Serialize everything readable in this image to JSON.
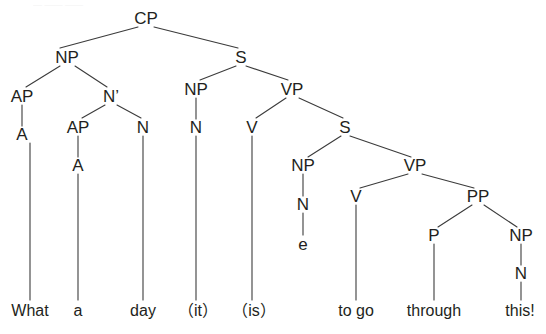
{
  "diagram": {
    "kind": "syntax-tree",
    "sentence": "What a day (it is) to go through this!",
    "line_color": "#3b3b3b",
    "text_color": "#231f20",
    "background": "#ffffff",
    "nodes": [
      {
        "id": "cp",
        "label": "CP",
        "x": 146,
        "y": 18,
        "type": "nonterminal"
      },
      {
        "id": "np1",
        "label": "NP",
        "x": 67,
        "y": 57,
        "type": "nonterminal"
      },
      {
        "id": "s1",
        "label": "S",
        "x": 241,
        "y": 57,
        "type": "nonterminal"
      },
      {
        "id": "ap1",
        "label": "AP",
        "x": 22,
        "y": 96,
        "type": "nonterminal"
      },
      {
        "id": "nbar",
        "label": "N’",
        "x": 111,
        "y": 96,
        "type": "nonterminal"
      },
      {
        "id": "np2",
        "label": "NP",
        "x": 196,
        "y": 89,
        "type": "nonterminal"
      },
      {
        "id": "vp1",
        "label": "VP",
        "x": 292,
        "y": 89,
        "type": "nonterminal"
      },
      {
        "id": "a1",
        "label": "A",
        "x": 22,
        "y": 134,
        "type": "nonterminal"
      },
      {
        "id": "ap2",
        "label": "AP",
        "x": 78,
        "y": 127,
        "type": "nonterminal"
      },
      {
        "id": "n1",
        "label": "N",
        "x": 143,
        "y": 127,
        "type": "nonterminal"
      },
      {
        "id": "n2",
        "label": "N",
        "x": 196,
        "y": 127,
        "type": "nonterminal"
      },
      {
        "id": "v1",
        "label": "V",
        "x": 252,
        "y": 127,
        "type": "nonterminal"
      },
      {
        "id": "s2",
        "label": "S",
        "x": 345,
        "y": 127,
        "type": "nonterminal"
      },
      {
        "id": "a2",
        "label": "A",
        "x": 78,
        "y": 165,
        "type": "nonterminal"
      },
      {
        "id": "np3",
        "label": "NP",
        "x": 303,
        "y": 165,
        "type": "nonterminal"
      },
      {
        "id": "vp2",
        "label": "VP",
        "x": 415,
        "y": 165,
        "type": "nonterminal"
      },
      {
        "id": "n3",
        "label": "N",
        "x": 303,
        "y": 204,
        "type": "nonterminal"
      },
      {
        "id": "v2",
        "label": "V",
        "x": 356,
        "y": 196,
        "type": "nonterminal"
      },
      {
        "id": "pp",
        "label": "PP",
        "x": 478,
        "y": 196,
        "type": "nonterminal"
      },
      {
        "id": "e",
        "label": "e",
        "x": 303,
        "y": 244,
        "type": "empty-category"
      },
      {
        "id": "p",
        "label": "P",
        "x": 434,
        "y": 235,
        "type": "nonterminal"
      },
      {
        "id": "np4",
        "label": "NP",
        "x": 521,
        "y": 235,
        "type": "nonterminal"
      },
      {
        "id": "n4",
        "label": "N",
        "x": 521,
        "y": 273,
        "type": "nonterminal"
      }
    ],
    "terminals": [
      {
        "id": "w-what",
        "label": "What",
        "x": 30,
        "y": 311
      },
      {
        "id": "w-a",
        "label": "a",
        "x": 78,
        "y": 311
      },
      {
        "id": "w-day",
        "label": "day",
        "x": 143,
        "y": 311
      },
      {
        "id": "w-it",
        "label": "（it）",
        "x": 198,
        "y": 311
      },
      {
        "id": "w-is",
        "label": "（is）",
        "x": 254,
        "y": 311
      },
      {
        "id": "w-togo",
        "label": "to go",
        "x": 356,
        "y": 311
      },
      {
        "id": "w-through",
        "label": "through",
        "x": 434,
        "y": 311
      },
      {
        "id": "w-this",
        "label": "this!",
        "x": 520,
        "y": 311
      }
    ],
    "edges": [
      {
        "from": "cp",
        "to": "np1",
        "x1": 138,
        "y1": 27,
        "x2": 60,
        "y2": 48
      },
      {
        "from": "cp",
        "to": "s1",
        "x1": 154,
        "y1": 27,
        "x2": 238,
        "y2": 48
      },
      {
        "from": "np1",
        "to": "ap1",
        "x1": 60,
        "y1": 66,
        "x2": 26,
        "y2": 87
      },
      {
        "from": "np1",
        "to": "nbar",
        "x1": 75,
        "y1": 66,
        "x2": 107,
        "y2": 87
      },
      {
        "from": "s1",
        "to": "np2",
        "x1": 236,
        "y1": 66,
        "x2": 200,
        "y2": 80
      },
      {
        "from": "s1",
        "to": "vp1",
        "x1": 246,
        "y1": 66,
        "x2": 288,
        "y2": 80
      },
      {
        "from": "ap1",
        "to": "a1",
        "x1": 22,
        "y1": 105,
        "x2": 22,
        "y2": 126,
        "style": "short"
      },
      {
        "from": "nbar",
        "to": "ap2",
        "x1": 105,
        "y1": 105,
        "x2": 82,
        "y2": 118
      },
      {
        "from": "nbar",
        "to": "n1",
        "x1": 117,
        "y1": 105,
        "x2": 141,
        "y2": 118
      },
      {
        "from": "np2",
        "to": "n2",
        "x1": 196,
        "y1": 98,
        "x2": 196,
        "y2": 119,
        "style": "short"
      },
      {
        "from": "vp1",
        "to": "v1",
        "x1": 286,
        "y1": 98,
        "x2": 256,
        "y2": 118
      },
      {
        "from": "vp1",
        "to": "s2",
        "x1": 299,
        "y1": 98,
        "x2": 343,
        "y2": 118
      },
      {
        "from": "ap2",
        "to": "a2",
        "x1": 78,
        "y1": 136,
        "x2": 78,
        "y2": 157,
        "style": "short"
      },
      {
        "from": "s2",
        "to": "np3",
        "x1": 341,
        "y1": 136,
        "x2": 308,
        "y2": 157
      },
      {
        "from": "s2",
        "to": "vp2",
        "x1": 350,
        "y1": 136,
        "x2": 411,
        "y2": 157
      },
      {
        "from": "np3",
        "to": "n3",
        "x1": 303,
        "y1": 174,
        "x2": 303,
        "y2": 196,
        "style": "short"
      },
      {
        "from": "vp2",
        "to": "v2",
        "x1": 408,
        "y1": 174,
        "x2": 360,
        "y2": 188
      },
      {
        "from": "vp2",
        "to": "pp",
        "x1": 422,
        "y1": 174,
        "x2": 474,
        "y2": 188
      },
      {
        "from": "n3",
        "to": "e",
        "x1": 303,
        "y1": 213,
        "x2": 303,
        "y2": 235,
        "style": "short"
      },
      {
        "from": "pp",
        "to": "p",
        "x1": 472,
        "y1": 205,
        "x2": 438,
        "y2": 227
      },
      {
        "from": "pp",
        "to": "np4",
        "x1": 484,
        "y1": 205,
        "x2": 517,
        "y2": 227
      },
      {
        "from": "np4",
        "to": "n4",
        "x1": 521,
        "y1": 244,
        "x2": 521,
        "y2": 265,
        "style": "short"
      },
      {
        "from": "a1",
        "to": "w-what",
        "x1": 30,
        "y1": 143,
        "x2": 30,
        "y2": 300,
        "style": "long"
      },
      {
        "from": "a2",
        "to": "w-a",
        "x1": 78,
        "y1": 174,
        "x2": 78,
        "y2": 300,
        "style": "long"
      },
      {
        "from": "n1",
        "to": "w-day",
        "x1": 143,
        "y1": 136,
        "x2": 143,
        "y2": 300,
        "style": "long"
      },
      {
        "from": "n2",
        "to": "w-it",
        "x1": 196,
        "y1": 136,
        "x2": 196,
        "y2": 300,
        "style": "long"
      },
      {
        "from": "v1",
        "to": "w-is",
        "x1": 252,
        "y1": 136,
        "x2": 252,
        "y2": 300,
        "style": "long"
      },
      {
        "from": "v2",
        "to": "w-togo",
        "x1": 356,
        "y1": 205,
        "x2": 356,
        "y2": 300,
        "style": "long"
      },
      {
        "from": "p",
        "to": "w-through",
        "x1": 434,
        "y1": 244,
        "x2": 434,
        "y2": 300,
        "style": "long"
      },
      {
        "from": "n4",
        "to": "w-this",
        "x1": 521,
        "y1": 282,
        "x2": 521,
        "y2": 300,
        "style": "long"
      }
    ],
    "artifact_text": "— —— ——"
  }
}
